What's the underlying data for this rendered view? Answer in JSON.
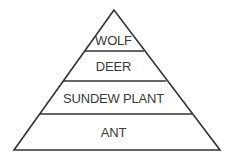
{
  "diagram": {
    "type": "energy-pyramid",
    "levels": [
      {
        "label": "WOLF"
      },
      {
        "label": "DEER"
      },
      {
        "label": "SUNDEW PLANT"
      },
      {
        "label": "ANT"
      }
    ],
    "stroke_color": "#333333"
  }
}
